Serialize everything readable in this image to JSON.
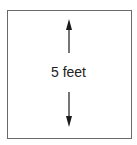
{
  "diagram": {
    "shape": "square",
    "dimension_label": "5 feet",
    "arrows": [
      "up-arrow",
      "down-arrow"
    ],
    "colors": {
      "border": "#6a6a6a",
      "arrow": "#1a1a1a",
      "text": "#222222"
    }
  }
}
